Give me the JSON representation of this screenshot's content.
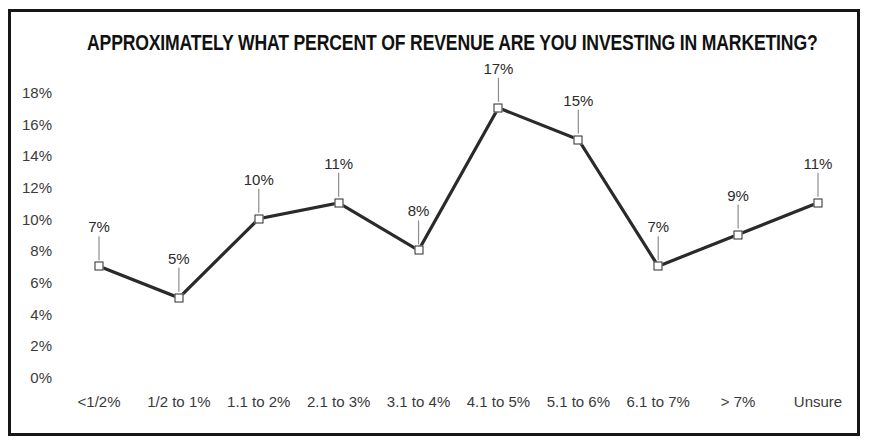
{
  "chart_data": {
    "type": "line",
    "title": "APPROXIMATELY WHAT PERCENT OF REVENUE ARE YOU INVESTING IN MARKETING?",
    "xlabel": "",
    "ylabel": "",
    "categories": [
      "<1/2%",
      "1/2 to 1%",
      "1.1 to 2%",
      "2.1 to 3%",
      "3.1 to 4%",
      "4.1 to 5%",
      "5.1 to 6%",
      "6.1 to 7%",
      "> 7%",
      "Unsure"
    ],
    "values": [
      7,
      5,
      10,
      11,
      8,
      17,
      15,
      7,
      9,
      11
    ],
    "data_labels": [
      "7%",
      "5%",
      "10%",
      "11%",
      "8%",
      "17%",
      "15%",
      "7%",
      "9%",
      "11%"
    ],
    "ytick_labels": [
      "18%",
      "16%",
      "14%",
      "12%",
      "10%",
      "8%",
      "6%",
      "4%",
      "2%",
      "0%"
    ],
    "ytick_values": [
      18,
      16,
      14,
      12,
      10,
      8,
      6,
      4,
      2,
      0
    ],
    "ylim": [
      0,
      18
    ],
    "grid": false,
    "legend": null,
    "line_color": "#2a2a2a",
    "marker_color": "#2a2a2a",
    "marker_fill": "#ffffff",
    "background_color": "#ffffff",
    "border_color": "#171717",
    "text_color": "#3a3a3a"
  }
}
